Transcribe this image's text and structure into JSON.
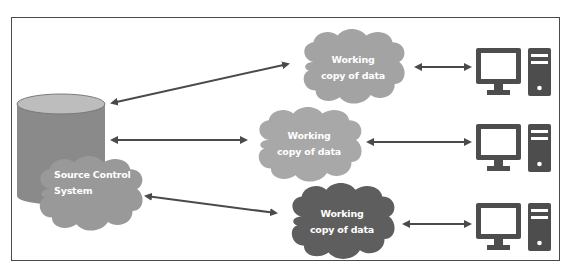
{
  "diagram": {
    "type": "centralized-version-control",
    "source": {
      "label_line1": "Source Control",
      "label_line2": "System",
      "cylinder_color": "#8a8a8a",
      "cylinder_top_color": "#bdbdbd",
      "cloud_color": "#999999"
    },
    "working_copies": [
      {
        "label_line1": "Working",
        "label_line2": "copy of data",
        "cloud_color": "#a3a3a3"
      },
      {
        "label_line1": "Working",
        "label_line2": "copy of data",
        "cloud_color": "#a8a8a8"
      },
      {
        "label_line1": "Working",
        "label_line2": "copy of data",
        "cloud_color": "#5e5e5e"
      }
    ],
    "clients": [
      {
        "icon": "desktop-computer-icon"
      },
      {
        "icon": "desktop-computer-icon"
      },
      {
        "icon": "desktop-computer-icon"
      }
    ],
    "connections": [
      {
        "from": "source",
        "to": "working_copy_1",
        "type": "bidirectional"
      },
      {
        "from": "source",
        "to": "working_copy_2",
        "type": "bidirectional"
      },
      {
        "from": "source",
        "to": "working_copy_3",
        "type": "bidirectional"
      },
      {
        "from": "working_copy_1",
        "to": "client_1",
        "type": "bidirectional"
      },
      {
        "from": "working_copy_2",
        "to": "client_2",
        "type": "bidirectional"
      },
      {
        "from": "working_copy_3",
        "to": "client_3",
        "type": "bidirectional"
      }
    ],
    "colors": {
      "arrow": "#4a4a4a",
      "computer": "#4d4d4d",
      "frame": "#4a4a4a",
      "label_text": "#ffffff"
    }
  }
}
